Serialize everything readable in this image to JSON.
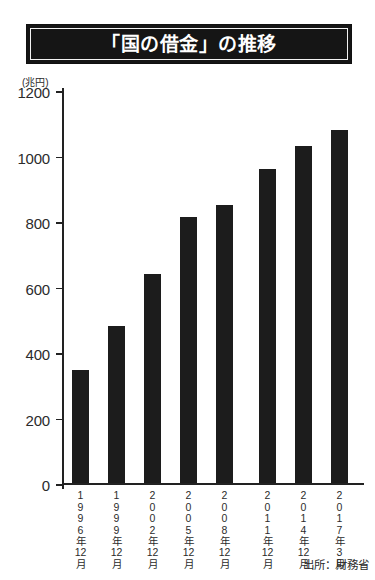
{
  "figure": {
    "title": "「国の借金」の推移",
    "unit_label": "(兆円)",
    "source_note": "出所：財務省"
  },
  "chart_data": {
    "type": "bar",
    "title": "「国の借金」の推移",
    "xlabel": "",
    "ylabel": "(兆円)",
    "ylim": [
      0,
      1200
    ],
    "yticks": [
      0,
      200,
      400,
      600,
      800,
      1000,
      1200
    ],
    "ytick_labels": [
      "0",
      "200",
      "400",
      "600",
      "800",
      "1000",
      "1200"
    ],
    "grid": false,
    "legend": false,
    "bar_color": "#1c1c1c",
    "categories": [
      "1996年12月",
      "1999年12月",
      "2002年12月",
      "2005年12月",
      "2008年12月",
      "2011年12月",
      "2014年12月",
      "2017年3月"
    ],
    "category_lines": [
      [
        "1",
        "9",
        "9",
        "6",
        "年",
        "12",
        "月"
      ],
      [
        "1",
        "9",
        "9",
        "9",
        "年",
        "12",
        "月"
      ],
      [
        "2",
        "0",
        "0",
        "2",
        "年",
        "12",
        "月"
      ],
      [
        "2",
        "0",
        "0",
        "5",
        "年",
        "12",
        "月"
      ],
      [
        "2",
        "0",
        "0",
        "8",
        "年",
        "12",
        "月"
      ],
      [
        "2",
        "0",
        "1",
        "1",
        "年",
        "12",
        "月"
      ],
      [
        "2",
        "0",
        "1",
        "4",
        "年",
        "12",
        "月"
      ],
      [
        "2",
        "0",
        "1",
        "7",
        "年",
        "3",
        "月"
      ]
    ],
    "values": [
      345,
      480,
      640,
      815,
      850,
      960,
      1030,
      1080
    ],
    "source": "出所：財務省"
  }
}
